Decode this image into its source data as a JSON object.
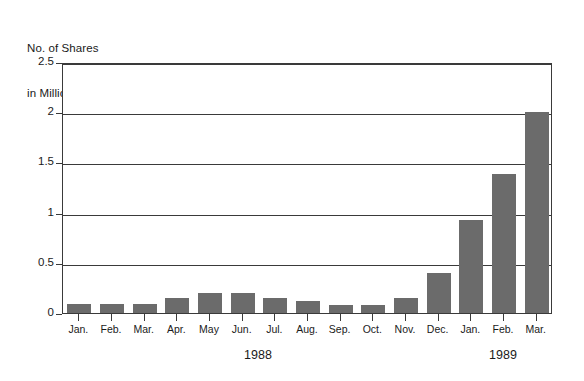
{
  "chart_data": {
    "type": "bar",
    "title": "No. of Shares in Millions",
    "title_lines": [
      "No. of Shares",
      "in Millions"
    ],
    "xlabel": "",
    "ylabel": "No. of Shares in Millions",
    "categories": [
      "Jan.",
      "Feb.",
      "Mar.",
      "Apr.",
      "May",
      "Jun.",
      "Jul.",
      "Aug.",
      "Sep.",
      "Oct.",
      "Nov.",
      "Dec.",
      "Jan.",
      "Feb.",
      "Mar."
    ],
    "values": [
      0.09,
      0.09,
      0.09,
      0.15,
      0.2,
      0.2,
      0.15,
      0.12,
      0.08,
      0.08,
      0.15,
      0.4,
      0.93,
      1.38,
      2.0
    ],
    "ylim": [
      0,
      2.5
    ],
    "ytick_labels": [
      "0",
      "0.5",
      "1",
      "1.5",
      "2",
      "2.5"
    ],
    "ytick_values": [
      0,
      0.5,
      1,
      1.5,
      2,
      2.5
    ],
    "grid": true,
    "grid_axis": "y",
    "legend": false,
    "legend_position": "none",
    "bar_color": "#6b6b6b",
    "axis_color": "#3a3a3a",
    "background_color": "#ffffff",
    "groups": [
      {
        "label": "1988",
        "start_index": 0,
        "end_index": 11
      },
      {
        "label": "1989",
        "start_index": 12,
        "end_index": 14
      }
    ]
  }
}
